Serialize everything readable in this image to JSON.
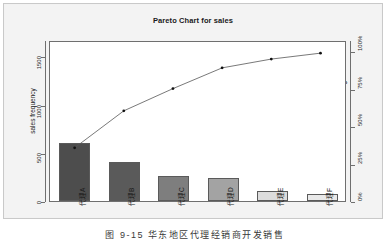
{
  "figure": {
    "caption": "图 9-15  华东地区代理经销商开发销售"
  },
  "chart_data": {
    "type": "bar",
    "title": "Pareto Chart for sales",
    "xlabel": "",
    "ylabel": "sales frequency",
    "y2label": "Cumulative Percentage",
    "categories": [
      "代理A",
      "代理B",
      "代理C",
      "代理D",
      "代理E",
      "代理F"
    ],
    "values": [
      600,
      400,
      260,
      235,
      100,
      75
    ],
    "cumulative_percent": [
      36,
      61,
      76,
      90,
      96,
      100
    ],
    "ylim": [
      0,
      1670
    ],
    "y2lim": [
      0,
      100
    ],
    "yticks": [
      0,
      500,
      1000,
      1500
    ],
    "ytick_labels": [
      "0",
      "500",
      "1000",
      "1500"
    ],
    "y2ticks": [
      0,
      25,
      50,
      75,
      100
    ],
    "y2tick_labels": [
      "0%",
      "25%",
      "50%",
      "75%",
      "100%"
    ],
    "grid": false,
    "legend": "none",
    "bar_colors": [
      "#4d4d4d",
      "#5a5a5a",
      "#7e7e7e",
      "#a3a3a3",
      "#dcdcdc",
      "#e9e9e9"
    ],
    "line_color": "#555555",
    "marker_color": "#111111"
  }
}
